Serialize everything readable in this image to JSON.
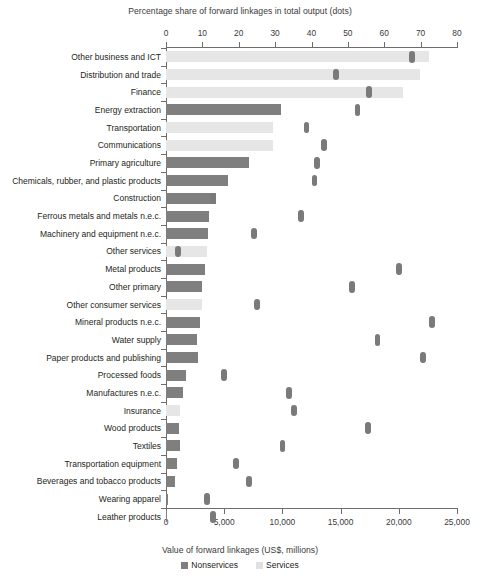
{
  "chart_data": {
    "type": "bar",
    "title": "",
    "top_axis_label": "Percentage share of forward linkages in total output (dots)",
    "xlabel": "Value of forward linkages (US$, millions)",
    "ylabel": "",
    "grid": false,
    "legend_position": "bottom",
    "orientation": "horizontal",
    "xlim": [
      0,
      25000
    ],
    "top_xlim": [
      0,
      80
    ],
    "top_ticks": [
      "0",
      "10",
      "20",
      "30",
      "40",
      "50",
      "60",
      "70",
      "80"
    ],
    "bottom_ticks": [
      "0",
      "5,000",
      "10,000",
      "15,000",
      "20,000",
      "25,000"
    ],
    "categories": [
      "Other business and ICT",
      "Distribution and trade",
      "Finance",
      "Energy extraction",
      "Transportation",
      "Communications",
      "Primary agriculture",
      "Chemicals, rubber, and plastic products",
      "Construction",
      "Ferrous metals and metals n.e.c.",
      "Machinery and equipment n.e.c.",
      "Other services",
      "Metal products",
      "Other primary",
      "Other consumer services",
      "Mineral products n.e.c.",
      "Water supply",
      "Paper products and publishing",
      "Processed foods",
      "Manufactures n.e.c.",
      "Insurance",
      "Wood products",
      "Textiles",
      "Transportation equipment",
      "Beverages and tobacco products",
      "Wearing apparel",
      "Leather products"
    ],
    "series": [
      {
        "name": "Value of forward linkages (US$, millions)",
        "type": "bar",
        "axis": "bottom",
        "group": [
          "services",
          "services",
          "services",
          "nonservices",
          "services",
          "services",
          "nonservices",
          "nonservices",
          "nonservices",
          "nonservices",
          "nonservices",
          "services",
          "nonservices",
          "nonservices",
          "services",
          "nonservices",
          "nonservices",
          "nonservices",
          "nonservices",
          "nonservices",
          "services",
          "nonservices",
          "nonservices",
          "nonservices",
          "nonservices",
          "nonservices",
          "nonservices"
        ],
        "values": [
          22600,
          21800,
          20400,
          9900,
          9150,
          9150,
          7150,
          5350,
          4300,
          3700,
          3600,
          3500,
          3350,
          3100,
          3100,
          2900,
          2650,
          2750,
          1720,
          1460,
          1200,
          1120,
          1180,
          950,
          780,
          190,
          120
        ]
      },
      {
        "name": "Percentage share of forward linkages in total output (dots)",
        "type": "scatter",
        "axis": "top",
        "values": [
          67.6,
          46.7,
          55.8,
          52.7,
          38.7,
          43.4,
          41.5,
          40.9,
          12.9,
          37.1,
          24.2,
          3.3,
          64.0,
          51.1,
          25.0,
          73.1,
          58.2,
          70.6,
          15.9,
          33.8,
          35.2,
          55.5,
          32.1,
          19.2,
          22.8,
          11.3,
          12.9
        ]
      }
    ],
    "legend": [
      {
        "label": "Nonservices",
        "color": "#7f7f7f"
      },
      {
        "label": "Services",
        "color": "#e0e0e0"
      }
    ]
  }
}
